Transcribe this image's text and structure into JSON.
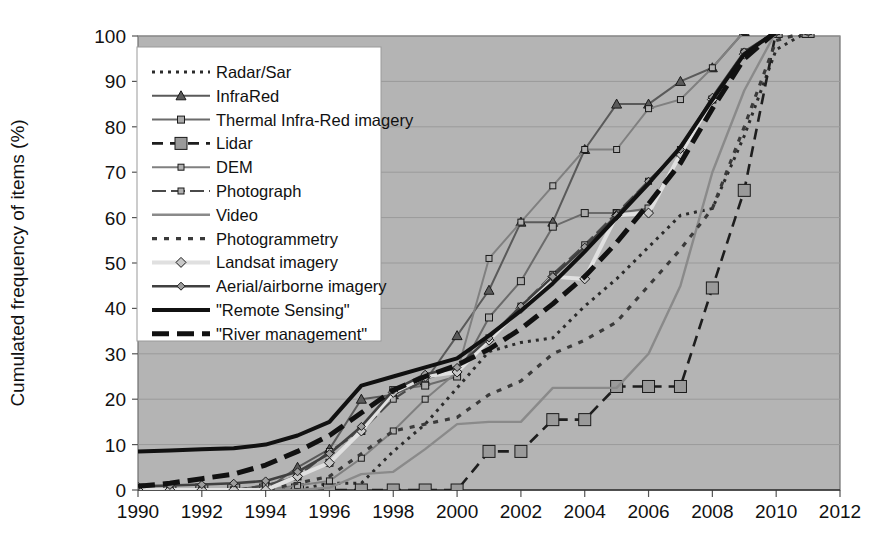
{
  "chart_data": {
    "type": "line",
    "title": "",
    "xlabel": "",
    "ylabel": "Cumulated frequency of items (%)",
    "xlim": [
      1990,
      2012
    ],
    "ylim": [
      0,
      100
    ],
    "xticks": [
      1990,
      1992,
      1994,
      1996,
      1998,
      2000,
      2002,
      2004,
      2006,
      2008,
      2010,
      2012
    ],
    "yticks": [
      0,
      10,
      20,
      30,
      40,
      50,
      60,
      70,
      80,
      90,
      100
    ],
    "grid": "horizontal",
    "legend_position": "upper-left-inside",
    "plot_background": "#b4b4b4",
    "x": [
      1990,
      1991,
      1992,
      1993,
      1994,
      1995,
      1996,
      1997,
      1998,
      1999,
      2000,
      2001,
      2002,
      2003,
      2004,
      2005,
      2006,
      2007,
      2008,
      2009,
      2010,
      2011
    ],
    "series": [
      {
        "name": "Radar/Sar",
        "color": "#2b2b2b",
        "dash": "3,5",
        "width": 3,
        "marker": "none",
        "values": [
          0,
          0,
          0,
          0,
          0,
          0,
          1.5,
          1.5,
          8.5,
          14.5,
          22.5,
          30.5,
          32.5,
          33.5,
          40.5,
          46.5,
          53.5,
          60.5,
          62.0,
          78.0,
          97.0,
          101.0
        ]
      },
      {
        "name": "InfraRed",
        "color": "#5a5a5a",
        "dash": "none",
        "width": 2,
        "marker": "triangle",
        "values": [
          0,
          0,
          0,
          0,
          0,
          5.0,
          9.0,
          20.0,
          21.0,
          24.0,
          34.0,
          44.0,
          59.0,
          59.0,
          75.0,
          85.0,
          85.0,
          90.0,
          93.0,
          101.0,
          101.0,
          101.0
        ]
      },
      {
        "name": "Thermal Infra-Red imagery",
        "color": "#6b6b6b",
        "dash": "none",
        "width": 2,
        "marker": "small-square",
        "values": [
          0,
          0,
          0,
          0,
          1.0,
          3.0,
          6.0,
          13.0,
          22.0,
          23.0,
          25.0,
          38.0,
          46.0,
          58.0,
          61.0,
          61.0,
          62.0,
          74.0,
          86.0,
          96.0,
          101.0,
          101.0
        ]
      },
      {
        "name": "Lidar",
        "color": "#1e1e1e",
        "dash": "11,7",
        "width": 2.6,
        "marker": "big-square",
        "values": [
          0,
          0,
          0,
          0,
          0,
          0,
          0,
          0,
          0,
          0,
          0,
          8.5,
          8.5,
          15.5,
          15.5,
          22.8,
          22.8,
          22.8,
          44.5,
          66.0,
          101.0,
          101.0
        ]
      },
      {
        "name": "DEM",
        "color": "#808080",
        "dash": "none",
        "width": 2,
        "marker": "tiny-square",
        "values": [
          0,
          0,
          0,
          0,
          0,
          1.0,
          2.0,
          7.0,
          13.0,
          20.0,
          26.0,
          51.0,
          59.0,
          67.0,
          75.0,
          75.0,
          84.0,
          86.0,
          93.0,
          101.0,
          101.0,
          101.0
        ]
      },
      {
        "name": "Photograph",
        "color": "#4a4a4a",
        "dash": "14,5",
        "width": 2.2,
        "marker": "tiny-square",
        "values": [
          0,
          0,
          0,
          0,
          1.0,
          3.0,
          8.5,
          13.0,
          20.0,
          24.5,
          26.5,
          33.5,
          40.5,
          47.5,
          54.0,
          61.0,
          68.0,
          75.0,
          86.0,
          96.5,
          101.0,
          101.0
        ]
      },
      {
        "name": "Video",
        "color": "#8a8a8a",
        "dash": "none",
        "width": 2.4,
        "marker": "none",
        "values": [
          0,
          0,
          0,
          0,
          0,
          0,
          0.5,
          3.5,
          4.0,
          9.0,
          14.5,
          15.0,
          15.0,
          22.5,
          22.5,
          22.5,
          30.0,
          45.0,
          70.0,
          88.0,
          101.0,
          101.0
        ]
      },
      {
        "name": "Photogrammetry",
        "color": "#3a3a3a",
        "dash": "5,7",
        "width": 3.2,
        "marker": "none",
        "values": [
          0,
          0,
          0,
          0,
          0,
          1.5,
          3.0,
          8.0,
          13.0,
          14.5,
          16.0,
          21.0,
          24.0,
          30.0,
          33.0,
          37.0,
          45.0,
          53.0,
          62.0,
          80.0,
          99.0,
          101.0
        ]
      },
      {
        "name": "Landsat imagery",
        "color": "#e0e0e0",
        "dash": "none",
        "width": 4,
        "marker": "diamond",
        "values": [
          0,
          0,
          0,
          0,
          0,
          3.0,
          6.0,
          13.0,
          21.5,
          25.0,
          26.0,
          33.0,
          40.0,
          47.0,
          46.5,
          60.5,
          61.0,
          74.0,
          86.0,
          96.0,
          101.0,
          101.0
        ]
      },
      {
        "name": "Aerial/airborne imagery",
        "color": "#404040",
        "dash": "none",
        "width": 2.6,
        "marker": "diamond-small",
        "values": [
          0.8,
          1.0,
          1.2,
          1.5,
          2.0,
          4.0,
          8.0,
          14.0,
          22.0,
          25.5,
          27.0,
          33.5,
          40.5,
          47.0,
          53.5,
          60.5,
          68.0,
          75.0,
          86.5,
          96.5,
          101.0,
          101.0
        ]
      },
      {
        "name": "\"Remote Sensing\"",
        "color": "#111111",
        "dash": "none",
        "width": 4,
        "marker": "none",
        "values": [
          8.5,
          8.7,
          9.0,
          9.2,
          10.0,
          12.0,
          15.0,
          23.0,
          25.0,
          27.0,
          29.0,
          34.0,
          39.5,
          45.5,
          52.5,
          60.0,
          67.5,
          75.5,
          86.0,
          96.0,
          101.0,
          101.0
        ]
      },
      {
        "name": "\"River management\"",
        "color": "#111111",
        "dash": "17,8",
        "width": 5,
        "marker": "none",
        "values": [
          0.8,
          1.5,
          2.5,
          3.5,
          5.5,
          8.5,
          12.0,
          17.0,
          22.0,
          25.0,
          27.5,
          31.0,
          35.5,
          41.0,
          47.0,
          54.5,
          63.0,
          72.0,
          84.0,
          95.0,
          101.0,
          101.0
        ]
      }
    ]
  },
  "legend": {
    "items": [
      {
        "label": "Radar/Sar"
      },
      {
        "label": "InfraRed"
      },
      {
        "label": "Thermal Infra-Red imagery"
      },
      {
        "label": "Lidar"
      },
      {
        "label": "DEM"
      },
      {
        "label": "Photograph"
      },
      {
        "label": "Video"
      },
      {
        "label": "Photogrammetry"
      },
      {
        "label": "Landsat imagery"
      },
      {
        "label": "Aerial/airborne imagery"
      },
      {
        "label": "\"Remote Sensing\""
      },
      {
        "label": "\"River management\""
      }
    ]
  }
}
